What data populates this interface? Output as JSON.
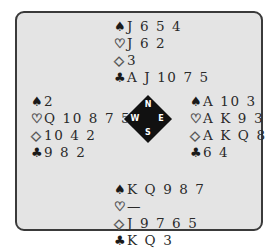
{
  "diagram": {
    "type": "bridge-deal",
    "compass": {
      "north": "N",
      "south": "S",
      "east": "E",
      "west": "W"
    },
    "suit_symbols": {
      "spades": "♠",
      "hearts": "♡",
      "diamonds": "◇",
      "clubs": "♣"
    },
    "hands": {
      "north": {
        "spades": "J 6 5 4",
        "hearts": "J 6 2",
        "diamonds": "3",
        "clubs": "A J 10 7 5"
      },
      "west": {
        "spades": "2",
        "hearts": "Q 10 8 7 5 4",
        "diamonds": "10 4 2",
        "clubs": "9 8 2"
      },
      "east": {
        "spades": "A 10 3",
        "hearts": "A K 9 3",
        "diamonds": "A K Q 8",
        "clubs": "6 4"
      },
      "south": {
        "spades": "K Q 9 8 7",
        "hearts": "—",
        "diamonds": "J 9 7 6 5",
        "clubs": "K Q 3"
      }
    }
  }
}
